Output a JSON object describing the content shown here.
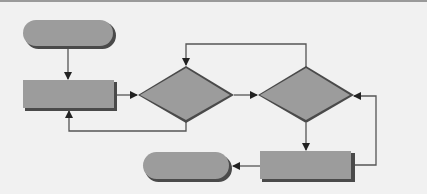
{
  "diagram": {
    "type": "flowchart",
    "colors": {
      "background": "#f1f1f1",
      "shape_fill": "#9c9c9c",
      "shape_shadow": "#4a4a4a",
      "connector": "#555555"
    },
    "nodes": [
      {
        "id": "start",
        "shape": "terminator",
        "label": ""
      },
      {
        "id": "process-1",
        "shape": "process",
        "label": ""
      },
      {
        "id": "decision-1",
        "shape": "decision",
        "label": ""
      },
      {
        "id": "decision-2",
        "shape": "decision",
        "label": ""
      },
      {
        "id": "process-2",
        "shape": "process",
        "label": ""
      },
      {
        "id": "end",
        "shape": "terminator",
        "label": ""
      }
    ],
    "edges": [
      {
        "from": "start",
        "to": "process-1"
      },
      {
        "from": "process-1",
        "to": "decision-1"
      },
      {
        "from": "decision-1",
        "to": "process-1",
        "route": "loop-back-below"
      },
      {
        "from": "decision-1",
        "to": "decision-2"
      },
      {
        "from": "decision-2",
        "to": "decision-1",
        "route": "loop-back-above"
      },
      {
        "from": "decision-2",
        "to": "process-2"
      },
      {
        "from": "process-2",
        "to": "decision-2",
        "route": "loop-back-right"
      },
      {
        "from": "process-2",
        "to": "end"
      }
    ]
  }
}
